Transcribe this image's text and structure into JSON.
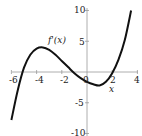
{
  "chart_data": {
    "type": "line",
    "title": "",
    "xlabel": "x",
    "ylabel": "",
    "series": [
      {
        "name": "f'(x)",
        "x": [
          -6,
          -5.5,
          -5,
          -4.5,
          -4,
          -3.5,
          -3,
          -2.5,
          -2,
          -1.5,
          -1,
          -0.5,
          0,
          0.5,
          1,
          1.5,
          2,
          2.5,
          3,
          3.5
        ],
        "y": [
          -7.8,
          -3,
          0.7,
          2.8,
          3.8,
          4,
          3.6,
          2.8,
          1.8,
          0.8,
          -0.2,
          -1,
          -1.6,
          -2,
          -2.2,
          -1.6,
          -0.2,
          2,
          5.2,
          10
        ]
      }
    ],
    "xlim": [
      -6.5,
      4.2
    ],
    "ylim": [
      -10.5,
      10.5
    ],
    "x_ticks": [
      "-6",
      "-4",
      "-2",
      "0",
      "2",
      "4"
    ],
    "y_ticks": [
      "10",
      "5",
      "-5",
      "-10"
    ],
    "annotations": [
      "f'(x)",
      "x"
    ],
    "grid": false,
    "legend": "none"
  },
  "labels": {
    "curve": "f'(x)",
    "x_axis": "x",
    "xt": [
      "-6",
      "-4",
      "-2",
      "0",
      "2",
      "4"
    ],
    "yt": [
      "10",
      "5",
      "-5",
      "-10"
    ]
  }
}
